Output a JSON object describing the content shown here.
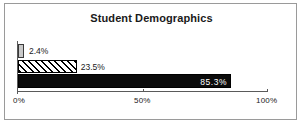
{
  "chart_data": {
    "type": "bar",
    "orientation": "horizontal",
    "title": "Student Demographics",
    "xlabel": "",
    "ylabel": "",
    "categories": [
      "series-1",
      "series-2",
      "series-3"
    ],
    "values": [
      2.4,
      23.5,
      85.3
    ],
    "data_labels": [
      "2.4%",
      "23.5%",
      "85.3%"
    ],
    "xlim": [
      0,
      100
    ],
    "xticks": [
      0,
      50,
      100
    ],
    "xtick_labels": [
      "0%",
      "50%",
      "100%"
    ],
    "grid": false,
    "legend": "none",
    "series_styles": [
      {
        "name": "bar-1",
        "fill": "#c9c9c9",
        "pattern": "solid",
        "border": "#3a3a3a"
      },
      {
        "name": "bar-2",
        "fill": "#ffffff",
        "pattern": "diagonal-hatch",
        "border": "#000000"
      },
      {
        "name": "bar-3",
        "fill": "#0b0b0b",
        "pattern": "solid",
        "border": "#000000"
      }
    ],
    "colors": {
      "background": "#ffffff",
      "frame_border": "#9a9a9a",
      "axis": "#5a5a5a",
      "text": "#1a1a1a",
      "inverse_text": "#ffffff"
    }
  },
  "chart": {
    "title": "Student Demographics",
    "bars": [
      {
        "label": "2.4%",
        "value": 2.4,
        "label_position": "outside"
      },
      {
        "label": "23.5%",
        "value": 23.5,
        "label_position": "outside"
      },
      {
        "label": "85.3%",
        "value": 85.3,
        "label_position": "inside"
      }
    ],
    "axis": {
      "ticks": [
        {
          "label": "0%"
        },
        {
          "label": "50%"
        },
        {
          "label": "100%"
        }
      ]
    }
  }
}
